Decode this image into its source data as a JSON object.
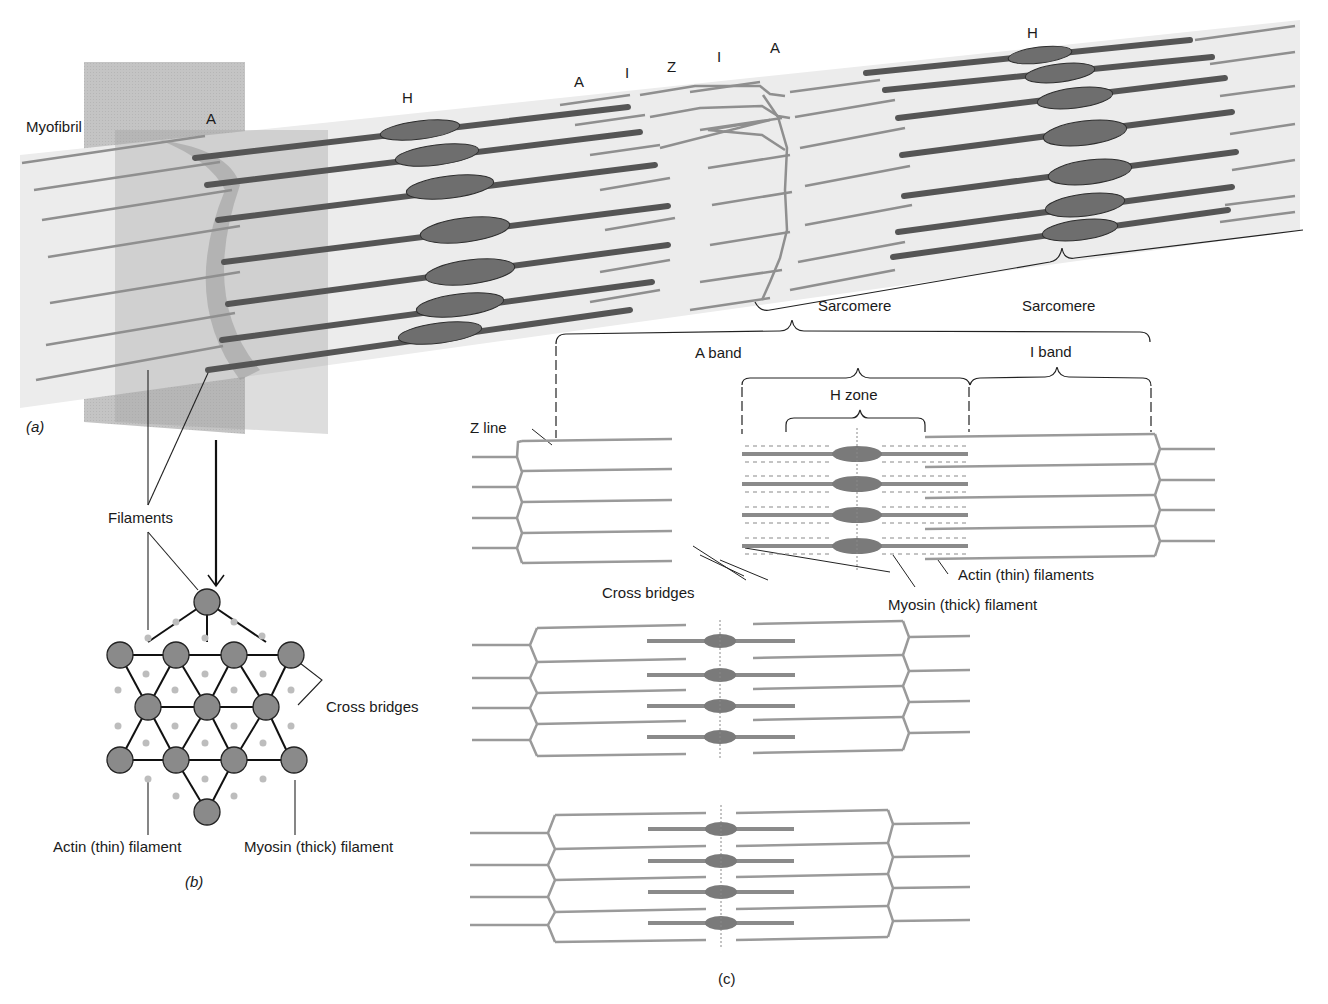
{
  "panel_a": {
    "tag": "(a)",
    "myofibril_label": "Myofibril",
    "band_labels_left": [
      "A",
      "H",
      "A",
      "I",
      "Z",
      "I",
      "A",
      "H"
    ],
    "sarcomere_label": "Sarcomere"
  },
  "panel_b": {
    "tag": "(b)",
    "filaments_label": "Filaments",
    "cross_bridges_label": "Cross bridges",
    "actin_label": "Actin (thin) filament",
    "myosin_label": "Myosin (thick) filament"
  },
  "panel_c": {
    "tag": "(c)",
    "sarcomere_label": "Sarcomere",
    "a_band_label": "A band",
    "i_band_label": "I band",
    "h_zone_label": "H zone",
    "z_line_label": "Z line",
    "cross_bridges_label": "Cross bridges",
    "actin_label": "Actin (thin) filaments",
    "myosin_label": "Myosin (thick) filament"
  },
  "colors": {
    "myofibril_fill": "#ebebeb",
    "plane_fill": "#b3b3b3",
    "thick_filament": "#555555",
    "thin_filament": "#8f8f8f",
    "myosin_gray": "#7a7a7a"
  }
}
